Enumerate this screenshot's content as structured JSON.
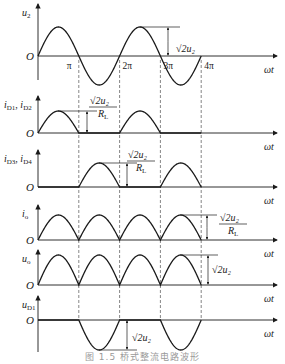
{
  "figure": {
    "caption": "图 1.5   桥式整流电路波形",
    "axis_x_label": "ωt",
    "origin_label": "O",
    "tick_labels": [
      "π",
      "2π",
      "3π",
      "4π"
    ],
    "line_color": "#1a1a1a",
    "dash_color": "#333333"
  },
  "panels": [
    {
      "id": "u2",
      "ylabel": "u",
      "ysub": "2",
      "waveform": "sine",
      "amp_label": "√2u₂",
      "amp_unit": ""
    },
    {
      "id": "iD12",
      "ylabel": "i",
      "ysub": "D1",
      "ylabel2": "i",
      "ysub2": "D2",
      "waveform": "half-wave-odd",
      "amp_label": "√2u₂",
      "amp_unit": "R",
      "amp_unit_sub": "L"
    },
    {
      "id": "iD34",
      "ylabel": "i",
      "ysub": "D3",
      "ylabel2": "i",
      "ysub2": "D4",
      "waveform": "half-wave-even",
      "amp_label": "√2u₂",
      "amp_unit": "R",
      "amp_unit_sub": "L"
    },
    {
      "id": "io",
      "ylabel": "i",
      "ysub": "o",
      "waveform": "full-wave",
      "amp_label": "√2u₂",
      "amp_unit": "R",
      "amp_unit_sub": "L"
    },
    {
      "id": "uo",
      "ylabel": "u",
      "ysub": "o",
      "waveform": "full-wave",
      "amp_label": "√2u₂",
      "amp_unit": ""
    },
    {
      "id": "uD1",
      "ylabel": "u",
      "ysub": "D1",
      "waveform": "neg-half-even",
      "amp_label": "√2u₂",
      "amp_unit": ""
    }
  ]
}
